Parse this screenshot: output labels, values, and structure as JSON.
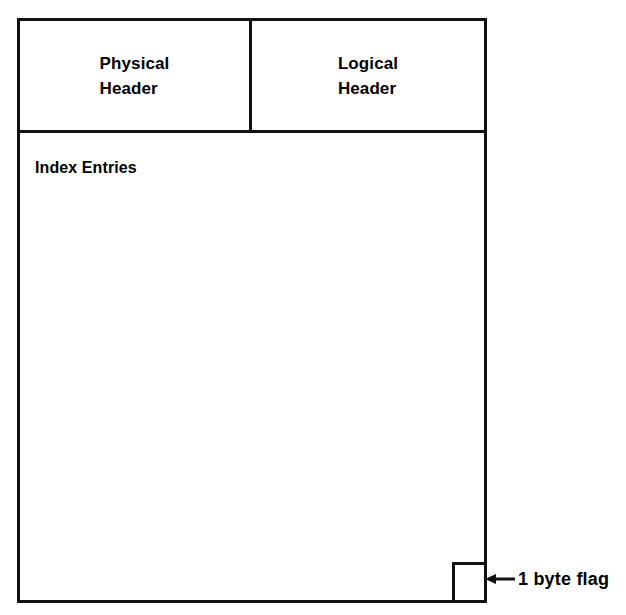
{
  "diagram": {
    "colors": {
      "line": "#111111",
      "background": "#ffffff",
      "text": "#000000"
    },
    "header_row": {
      "physical_header_label": "Physical\nHeader",
      "logical_header_label": "Logical\nHeader"
    },
    "body": {
      "index_entries_label": "Index Entries"
    },
    "flag": {
      "box_label": "",
      "annotation_label": "1 byte flag",
      "arrow_icon": "arrow-left-icon"
    }
  }
}
